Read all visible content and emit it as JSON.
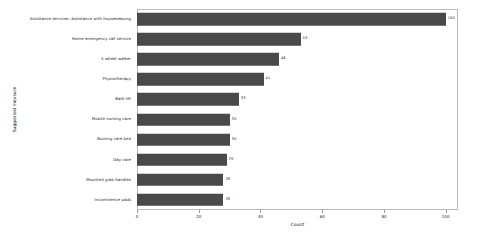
{
  "chart_data": {
    "type": "bar",
    "orientation": "horizontal",
    "title": "",
    "xlabel": "Count",
    "ylabel": "Suggested measure",
    "xlim": [
      0,
      104
    ],
    "ylim": [
      0,
      10
    ],
    "grid": false,
    "legend": null,
    "bar_color": "#4a4a4a",
    "frame_color": "#b9b9b9",
    "show_value_labels": true,
    "xticks": [
      0,
      20,
      40,
      60,
      80,
      100
    ],
    "xtick_labels": [
      "0",
      "20",
      "40",
      "60",
      "80",
      "100"
    ],
    "categories": [
      "Assistance services: assistance with housekeeping",
      "Home emergency call service",
      "4 wheel walker",
      "Physiotherapy",
      "Bath lift",
      "Mobile nursing care",
      "Nursing care bed",
      "Day care",
      "Mounted grab handles",
      "Incontinence pads"
    ],
    "values": [
      100,
      53,
      46,
      41,
      33,
      30,
      30,
      29,
      28,
      28
    ],
    "value_labels": [
      "100",
      "53",
      "46",
      "41",
      "33",
      "30",
      "30",
      "29",
      "28",
      "28"
    ]
  }
}
